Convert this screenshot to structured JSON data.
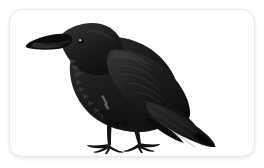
{
  "canvas": {
    "width": 264,
    "height": 168,
    "background_color": "#ffffff"
  },
  "card": {
    "name": "illustration-card",
    "background_color": "#ffffff",
    "border_color": "#e9e9e9",
    "shadow_color": "rgba(0,0,0,0.07)",
    "corner_radius": 13,
    "x": 9,
    "y": 9,
    "width": 246,
    "height": 148
  },
  "illustration": {
    "subject": "crow",
    "alt_text": "Black crow standing in profile facing left with long tail angled down to the right",
    "facing": "left",
    "palette": {
      "body_black": "#1b1b1b",
      "deep_black": "#0d0d0d",
      "wing_shadow": "#242424",
      "highlight_gray": "#4a4a4a",
      "feather_edge": "#5d5d5d",
      "eye_light": "#cfcfcf",
      "leg_black": "#151515"
    },
    "parts": [
      {
        "name": "beak",
        "label": "Beak"
      },
      {
        "name": "eye",
        "label": "Eye"
      },
      {
        "name": "head",
        "label": "Head"
      },
      {
        "name": "throat-hackles",
        "label": "Throat hackles"
      },
      {
        "name": "breast",
        "label": "Breast"
      },
      {
        "name": "back",
        "label": "Back"
      },
      {
        "name": "wing",
        "label": "Folded wing"
      },
      {
        "name": "wing-coverts",
        "label": "Wing coverts"
      },
      {
        "name": "primaries",
        "label": "Primary feathers"
      },
      {
        "name": "tail",
        "label": "Tail"
      },
      {
        "name": "left-leg",
        "label": "Left leg"
      },
      {
        "name": "right-leg",
        "label": "Right leg"
      },
      {
        "name": "left-foot",
        "label": "Left foot"
      },
      {
        "name": "right-foot",
        "label": "Right foot"
      }
    ]
  }
}
